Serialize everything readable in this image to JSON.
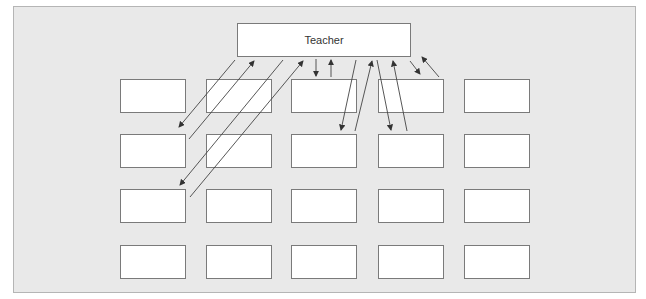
{
  "diagram": {
    "teacher_label": "Teacher",
    "student_grid": {
      "rows": 4,
      "columns": 5
    },
    "colors": {
      "panel": "#e9e9e9",
      "box": "#ffffff",
      "border": "#7a7a7a",
      "arrow": "#333333"
    },
    "arrows_description": "Two-way arrows between teacher and students in first two rows"
  }
}
